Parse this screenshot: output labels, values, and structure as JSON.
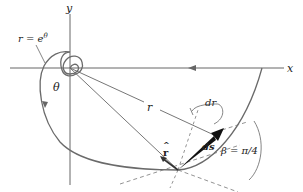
{
  "figure": {
    "axes": {
      "x_label": "x",
      "y_label": "y"
    },
    "curve_label": "r = e",
    "curve_label_exp": "θ",
    "angle_label": "θ",
    "radius_label": "r",
    "dr_label": "dr",
    "unit_r_label": "r",
    "unit_r_hat": "^",
    "ds_label": "ds",
    "beta_label": "β = π/4",
    "colors": {
      "curve": "#6a6a6a",
      "axes": "#555555",
      "vector": "#111111",
      "text": "#222222"
    }
  }
}
